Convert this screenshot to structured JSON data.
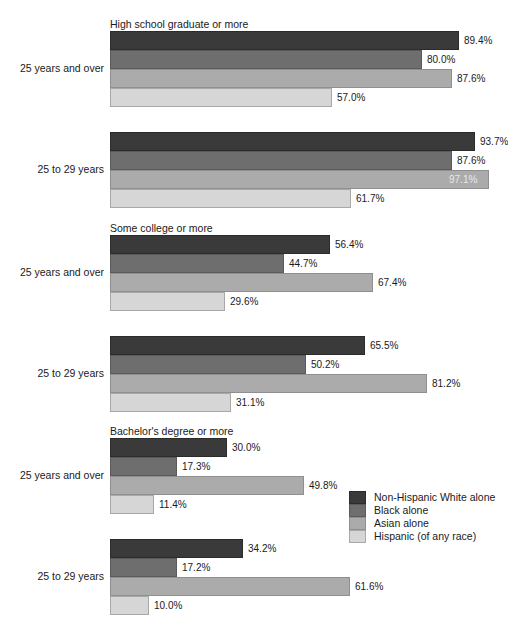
{
  "chart_data": {
    "type": "bar",
    "orientation": "horizontal",
    "title": "",
    "xlabel": "",
    "ylabel": "",
    "xlim": [
      0,
      100
    ],
    "grid": false,
    "legend_position": "right-bottom",
    "value_suffix": "%",
    "legend": [
      "Non-Hispanic White alone",
      "Black alone",
      "Asian alone",
      "Hispanic (of any race)"
    ],
    "colors": [
      "#3a3a3a",
      "#6e6e6e",
      "#ababab",
      "#d6d6d6"
    ],
    "panels": [
      {
        "title": "High school graduate or more",
        "groups": [
          {
            "label": "25 years and over",
            "values": [
              89.4,
              80.0,
              87.6,
              57.0
            ],
            "labels": [
              "89.4%",
              "80.0%",
              "87.6%",
              "57.0%"
            ],
            "label_inside": [
              false,
              false,
              false,
              false
            ]
          },
          {
            "label": "25 to 29 years",
            "values": [
              93.7,
              87.6,
              97.1,
              61.7
            ],
            "labels": [
              "93.7%",
              "87.6%",
              "97.1%",
              "61.7%"
            ],
            "label_inside": [
              false,
              false,
              true,
              false
            ]
          }
        ]
      },
      {
        "title": "Some college or more",
        "groups": [
          {
            "label": "25 years and over",
            "values": [
              56.4,
              44.7,
              67.4,
              29.6
            ],
            "labels": [
              "56.4%",
              "44.7%",
              "67.4%",
              "29.6%"
            ],
            "label_inside": [
              false,
              false,
              false,
              false
            ]
          },
          {
            "label": "25 to 29 years",
            "values": [
              65.5,
              50.2,
              81.2,
              31.1
            ],
            "labels": [
              "65.5%",
              "50.2%",
              "81.2%",
              "31.1%"
            ],
            "label_inside": [
              false,
              false,
              false,
              false
            ]
          }
        ]
      },
      {
        "title": "Bachelor's degree or more",
        "groups": [
          {
            "label": "25 years and over",
            "values": [
              30.0,
              17.3,
              49.8,
              11.4
            ],
            "labels": [
              "30.0%",
              "17.3%",
              "49.8%",
              "11.4%"
            ],
            "label_inside": [
              false,
              false,
              false,
              false
            ]
          },
          {
            "label": "25 to 29 years",
            "values": [
              34.2,
              17.2,
              61.6,
              10.0
            ],
            "labels": [
              "34.2%",
              "17.2%",
              "61.6%",
              "10.0%"
            ],
            "label_inside": [
              false,
              false,
              false,
              false
            ]
          }
        ]
      }
    ]
  },
  "layout": {
    "panel_tops": [
      18,
      222,
      425
    ],
    "group_offsets": [
      13,
      114
    ],
    "bar_height": 19,
    "px_per_unit": 3.9,
    "legend_top": 491,
    "legend_left": 349
  }
}
